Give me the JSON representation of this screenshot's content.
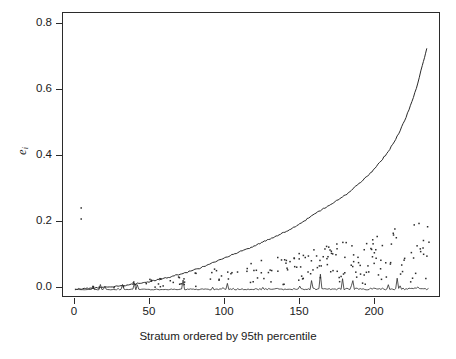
{
  "figure": {
    "background": "#ffffff",
    "ink_color": "#2b2b2b"
  },
  "axes": {
    "x_title": "Stratum ordered by 95th percentile",
    "y_title_base": "e",
    "y_title_sub": "i",
    "x_ticks": [
      "0",
      "50",
      "100",
      "150",
      "200"
    ],
    "y_ticks": [
      "0.0",
      "0.2",
      "0.4",
      "0.6",
      "0.8"
    ]
  },
  "chart_data": {
    "type": "line",
    "title": "",
    "xlabel": "Stratum ordered by 95th percentile",
    "ylabel": "e_i",
    "xlim": [
      -8,
      248
    ],
    "ylim": [
      -0.022,
      0.855
    ],
    "xticks": [
      0,
      50,
      100,
      150,
      200
    ],
    "yticks": [
      0.0,
      0.2,
      0.4,
      0.6,
      0.8
    ],
    "grid": false,
    "legend": "none",
    "n_strata": 240,
    "series": [
      {
        "name": "95th percentile (ordered, monotone increasing curve)",
        "type": "line",
        "x": [
          1,
          4,
          8,
          12,
          16,
          20,
          24,
          28,
          32,
          36,
          40,
          44,
          48,
          52,
          56,
          60,
          64,
          68,
          72,
          76,
          80,
          84,
          88,
          92,
          96,
          100,
          104,
          108,
          112,
          116,
          120,
          124,
          128,
          132,
          136,
          140,
          144,
          148,
          152,
          156,
          160,
          164,
          168,
          172,
          176,
          180,
          184,
          188,
          192,
          196,
          200,
          204,
          208,
          212,
          216,
          220,
          224,
          228,
          232,
          236,
          239
        ],
        "values": [
          0.002,
          0.003,
          0.004,
          0.005,
          0.006,
          0.008,
          0.009,
          0.011,
          0.013,
          0.015,
          0.017,
          0.02,
          0.023,
          0.026,
          0.03,
          0.034,
          0.038,
          0.043,
          0.048,
          0.053,
          0.059,
          0.065,
          0.072,
          0.079,
          0.086,
          0.094,
          0.101,
          0.109,
          0.117,
          0.124,
          0.131,
          0.139,
          0.147,
          0.155,
          0.163,
          0.171,
          0.18,
          0.19,
          0.2,
          0.212,
          0.224,
          0.236,
          0.247,
          0.258,
          0.268,
          0.28,
          0.292,
          0.306,
          0.322,
          0.338,
          0.355,
          0.374,
          0.396,
          0.42,
          0.448,
          0.48,
          0.52,
          0.568,
          0.62,
          0.69,
          0.742
        ]
      },
      {
        "name": "per-stratum value (noisy spiky line near zero)",
        "type": "line",
        "x_range": [
          1,
          240
        ],
        "baseline": 0.0,
        "typical": 0.004,
        "spike_max": 0.052,
        "description": "Dense jagged trace hugging 0 with occasional sharp upward spikes, amplitude growing slightly to the right"
      },
      {
        "name": "scatter points",
        "type": "scatter",
        "description": "Point cloud fanning out from near 0 at left to roughly 0.22 at right; two isolated outliers near x=5",
        "outliers": [
          [
            5,
            0.252
          ],
          [
            5,
            0.218
          ]
        ],
        "upper_envelope": {
          "x": [
            20,
            80,
            140,
            200,
            240
          ],
          "y": [
            0.012,
            0.05,
            0.105,
            0.165,
            0.23
          ]
        }
      }
    ]
  }
}
